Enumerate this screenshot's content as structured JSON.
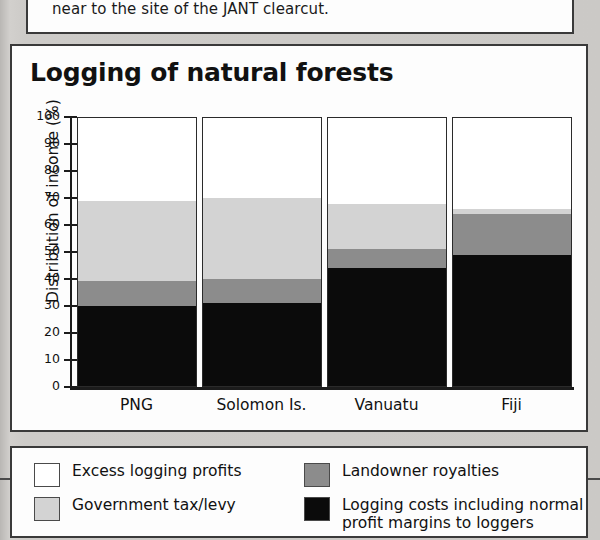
{
  "excerpt": {
    "text": "near to the site of the JANT clearcut."
  },
  "chart_panel": {
    "title": "Logging of natural forests"
  },
  "legend": {
    "items": [
      {
        "label": "Excess logging profits",
        "color": "#ffffff",
        "key": "excess_logging_profits"
      },
      {
        "label": "Government tax/levy",
        "color": "#d3d3d3",
        "key": "government_tax_levy"
      },
      {
        "label": "Landowner royalties",
        "color": "#8c8c8c",
        "key": "landowner_royalties"
      },
      {
        "label": "Logging costs including normal\nprofit margins to loggers",
        "color": "#0b0b0b",
        "key": "logging_costs"
      }
    ]
  },
  "chart_data": {
    "type": "bar",
    "stacked": true,
    "title": "Logging of natural forests",
    "xlabel": "",
    "ylabel": "Distribution of income (%)",
    "ylim": [
      0,
      100
    ],
    "yticks": [
      0,
      10,
      20,
      30,
      40,
      50,
      60,
      70,
      80,
      90,
      100
    ],
    "ytick_labels": [
      "0",
      "10",
      "20",
      "30",
      "40",
      "50",
      "60",
      "70",
      "80",
      "90",
      "100"
    ],
    "grid": false,
    "legend_position": "below-chart",
    "categories": [
      "PNG",
      "Solomon Is.",
      "Vanuatu",
      "Fiji"
    ],
    "series": [
      {
        "name": "Logging costs including normal profit margins to loggers",
        "color": "#0b0b0b",
        "values": [
          30,
          31,
          44,
          49
        ]
      },
      {
        "name": "Landowner royalties",
        "color": "#8c8c8c",
        "values": [
          9,
          9,
          7,
          15
        ]
      },
      {
        "name": "Government tax/levy",
        "color": "#d3d3d3",
        "values": [
          30,
          30,
          17,
          2
        ]
      },
      {
        "name": "Excess logging profits",
        "color": "#ffffff",
        "values": [
          31,
          30,
          32,
          34
        ]
      }
    ]
  }
}
